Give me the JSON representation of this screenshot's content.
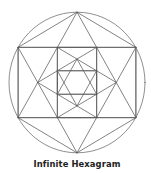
{
  "title": "Infinite Hexagram",
  "figure": {
    "center": [
      77,
      82.5
    ],
    "radius_x": 68,
    "radius_y": 70.3,
    "stroke_color": "#5a5a5a",
    "stroke_width": 0.75,
    "circle_color": "#6a6a6a",
    "levels": [
      {
        "name": "outer-hexagon",
        "points": [
          [
            0,
            -1
          ],
          [
            0.866,
            -0.5
          ],
          [
            0.866,
            0.5
          ],
          [
            0,
            1
          ],
          [
            -0.866,
            0.5
          ],
          [
            -0.866,
            -0.5
          ]
        ],
        "hexagon_edges": true,
        "triangles": [
          [
            0,
            2,
            4
          ],
          [
            3,
            5,
            1
          ]
        ],
        "rectangle": [
          5,
          1,
          2,
          4
        ]
      },
      {
        "name": "middle-hexagram",
        "points": [
          [
            -0.577,
            0
          ],
          [
            -0.289,
            -0.5
          ],
          [
            0.289,
            -0.5
          ],
          [
            0.577,
            0
          ],
          [
            0.289,
            0.5
          ],
          [
            -0.289,
            0.5
          ]
        ],
        "hexagon_edges": false,
        "triangles": [
          [
            0,
            2,
            4
          ],
          [
            3,
            5,
            1
          ]
        ],
        "rectangle": [
          1,
          2,
          4,
          5
        ]
      },
      {
        "name": "inner-hexagram",
        "points": [
          [
            0,
            -0.333
          ],
          [
            0.289,
            -0.167
          ],
          [
            0.289,
            0.167
          ],
          [
            0,
            0.333
          ],
          [
            -0.289,
            0.167
          ],
          [
            -0.289,
            -0.167
          ]
        ],
        "hexagon_edges": false,
        "triangles": [
          [
            0,
            2,
            4
          ],
          [
            3,
            5,
            1
          ]
        ],
        "rectangle": [
          5,
          1,
          2,
          4
        ]
      }
    ]
  }
}
